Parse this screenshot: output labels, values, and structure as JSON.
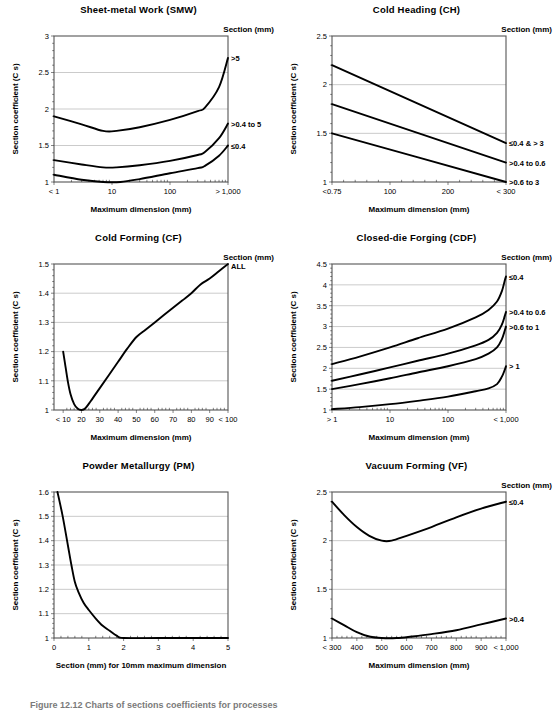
{
  "figure": {
    "caption": "Figure 12.12   Charts of sections coefficients for processes",
    "axis_labels": {
      "y_common": "Section coefficient (C s)",
      "x_max_dim": "Maximum dimension (mm)",
      "x_pm": "Section (mm) for 10mm maximum dimension"
    },
    "legend_header": "Section (mm)"
  },
  "chart_data": [
    {
      "type": "line",
      "id": "smw",
      "title": "Sheet-metal Work (SMW)",
      "xlabel": "Maximum dimension (mm)",
      "ylabel": "Section coefficient (C s)",
      "legend_title": "Section (mm)",
      "xscale": "log",
      "xlim": [
        1,
        1000
      ],
      "ylim": [
        1,
        3
      ],
      "yticks": [
        1,
        1.5,
        2,
        2.5,
        3
      ],
      "xticks": [
        1,
        10,
        100,
        1000
      ],
      "xticklabels": [
        "< 1",
        "10",
        "100",
        "> 1,000"
      ],
      "grid": true,
      "series": [
        {
          "name": ">5",
          "points": [
            [
              1,
              1.9
            ],
            [
              3,
              1.79
            ],
            [
              7,
              1.7
            ],
            [
              12,
              1.7
            ],
            [
              30,
              1.75
            ],
            [
              100,
              1.85
            ],
            [
              300,
              1.97
            ],
            [
              400,
              2.02
            ],
            [
              700,
              2.3
            ],
            [
              1000,
              2.7
            ]
          ]
        },
        {
          "name": ">0.4 to 5",
          "points": [
            [
              1,
              1.3
            ],
            [
              3,
              1.24
            ],
            [
              7,
              1.2
            ],
            [
              12,
              1.2
            ],
            [
              30,
              1.23
            ],
            [
              100,
              1.29
            ],
            [
              300,
              1.37
            ],
            [
              400,
              1.41
            ],
            [
              700,
              1.6
            ],
            [
              1000,
              1.8
            ]
          ]
        },
        {
          "name": "≤0.4",
          "points": [
            [
              1,
              1.1
            ],
            [
              3,
              1.03
            ],
            [
              7,
              1.0
            ],
            [
              14,
              1.0
            ],
            [
              30,
              1.04
            ],
            [
              100,
              1.12
            ],
            [
              300,
              1.19
            ],
            [
              400,
              1.22
            ],
            [
              700,
              1.36
            ],
            [
              1000,
              1.5
            ]
          ]
        }
      ]
    },
    {
      "type": "line",
      "id": "ch",
      "title": "Cold Heading (CH)",
      "xlabel": "Maximum dimension (mm)",
      "ylabel": "Section coefficient (C s)",
      "legend_title": "Section (mm)",
      "xscale": "linear",
      "xlim": [
        0,
        300
      ],
      "ylim": [
        1,
        2.5
      ],
      "yticks": [
        1,
        1.5,
        2,
        2.5
      ],
      "xticks": [
        0,
        100,
        200,
        300
      ],
      "xticklabels": [
        "<0.75",
        "100",
        "200",
        "< 300"
      ],
      "grid": true,
      "series": [
        {
          "name": "≤0.4 & > 3",
          "points": [
            [
              0,
              2.2
            ],
            [
              300,
              1.4
            ]
          ]
        },
        {
          "name": ">0.4 to 0.6",
          "points": [
            [
              0,
              1.8
            ],
            [
              300,
              1.2
            ]
          ]
        },
        {
          "name": ">0.6 to 3",
          "points": [
            [
              0,
              1.5
            ],
            [
              300,
              1.0
            ]
          ]
        }
      ]
    },
    {
      "type": "line",
      "id": "cf",
      "title": "Cold Forming (CF)",
      "xlabel": "Maximum dimension (mm)",
      "ylabel": "Section coefficient (C s)",
      "legend_title": "Section (mm)",
      "xscale": "linear",
      "xlim": [
        5,
        100
      ],
      "ylim": [
        1,
        1.5
      ],
      "yticks": [
        1,
        1.1,
        1.2,
        1.3,
        1.4,
        1.5
      ],
      "xticks": [
        10,
        20,
        30,
        40,
        50,
        60,
        70,
        80,
        90,
        100
      ],
      "xticklabels": [
        "< 10",
        "20",
        "30",
        "40",
        "50",
        "60",
        "70",
        "80",
        "90",
        "< 100"
      ],
      "grid": true,
      "series": [
        {
          "name": "ALL",
          "points": [
            [
              10,
              1.2
            ],
            [
              11,
              1.16
            ],
            [
              12.5,
              1.1
            ],
            [
              14,
              1.055
            ],
            [
              16,
              1.02
            ],
            [
              18,
              1.004
            ],
            [
              20,
              1.0
            ],
            [
              22,
              1.005
            ],
            [
              25,
              1.03
            ],
            [
              30,
              1.075
            ],
            [
              35,
              1.12
            ],
            [
              40,
              1.165
            ],
            [
              45,
              1.21
            ],
            [
              50,
              1.25
            ],
            [
              55,
              1.275
            ],
            [
              60,
              1.3
            ],
            [
              65,
              1.325
            ],
            [
              70,
              1.35
            ],
            [
              75,
              1.375
            ],
            [
              80,
              1.4
            ],
            [
              85,
              1.43
            ],
            [
              90,
              1.45
            ],
            [
              95,
              1.475
            ],
            [
              100,
              1.5
            ]
          ]
        }
      ]
    },
    {
      "type": "line",
      "id": "cdf",
      "title": "Closed-die Forging (CDF)",
      "xlabel": "Maximum dimension (mm)",
      "ylabel": "Section coefficient (C s)",
      "legend_title": "Section (mm)",
      "xscale": "log",
      "xlim": [
        1,
        1000
      ],
      "ylim": [
        1,
        4.5
      ],
      "yticks": [
        1,
        1.5,
        2,
        2.5,
        3,
        3.5,
        4,
        4.5
      ],
      "xticks": [
        1,
        10,
        100,
        1000
      ],
      "xticklabels": [
        "> 1",
        "10",
        "100",
        "< 1,000"
      ],
      "grid": true,
      "series": [
        {
          "name": "≤0.4",
          "points": [
            [
              1,
              2.1
            ],
            [
              3,
              2.28
            ],
            [
              10,
              2.5
            ],
            [
              30,
              2.72
            ],
            [
              100,
              2.95
            ],
            [
              300,
              3.22
            ],
            [
              500,
              3.4
            ],
            [
              700,
              3.6
            ],
            [
              850,
              3.85
            ],
            [
              950,
              4.1
            ],
            [
              1000,
              4.2
            ]
          ]
        },
        {
          "name": ">0.4 to 0.6",
          "points": [
            [
              1,
              1.7
            ],
            [
              3,
              1.85
            ],
            [
              10,
              2.02
            ],
            [
              30,
              2.18
            ],
            [
              100,
              2.35
            ],
            [
              300,
              2.55
            ],
            [
              500,
              2.68
            ],
            [
              700,
              2.85
            ],
            [
              850,
              3.05
            ],
            [
              950,
              3.25
            ],
            [
              1000,
              3.35
            ]
          ]
        },
        {
          "name": ">0.6 to 1",
          "points": [
            [
              1,
              1.5
            ],
            [
              3,
              1.62
            ],
            [
              10,
              1.76
            ],
            [
              30,
              1.9
            ],
            [
              100,
              2.05
            ],
            [
              300,
              2.22
            ],
            [
              500,
              2.35
            ],
            [
              700,
              2.5
            ],
            [
              850,
              2.7
            ],
            [
              950,
              2.9
            ],
            [
              1000,
              3.0
            ]
          ]
        },
        {
          "name": "> 1",
          "points": [
            [
              1,
              1.02
            ],
            [
              3,
              1.07
            ],
            [
              10,
              1.14
            ],
            [
              30,
              1.22
            ],
            [
              100,
              1.32
            ],
            [
              300,
              1.45
            ],
            [
              500,
              1.52
            ],
            [
              700,
              1.62
            ],
            [
              850,
              1.8
            ],
            [
              950,
              1.96
            ],
            [
              1000,
              2.05
            ]
          ]
        }
      ]
    },
    {
      "type": "line",
      "id": "pm",
      "title": "Powder Metallurgy (PM)",
      "xlabel": "Section (mm) for 10mm maximum dimension",
      "ylabel": "Section coefficient (C s)",
      "legend_title": "",
      "xscale": "linear",
      "xlim": [
        0,
        5
      ],
      "ylim": [
        1,
        1.6
      ],
      "yticks": [
        1,
        1.1,
        1.2,
        1.3,
        1.4,
        1.5,
        1.6
      ],
      "xticks": [
        0,
        1,
        2,
        3,
        4,
        5
      ],
      "xticklabels": [
        "0",
        "1",
        "2",
        "3",
        "4",
        "5"
      ],
      "grid": true,
      "series": [
        {
          "name": "",
          "points": [
            [
              0.1,
              1.6
            ],
            [
              0.25,
              1.5
            ],
            [
              0.4,
              1.38
            ],
            [
              0.5,
              1.3
            ],
            [
              0.6,
              1.23
            ],
            [
              0.7,
              1.19
            ],
            [
              0.85,
              1.145
            ],
            [
              1.0,
              1.115
            ],
            [
              1.2,
              1.08
            ],
            [
              1.4,
              1.05
            ],
            [
              1.6,
              1.03
            ],
            [
              1.8,
              1.01
            ],
            [
              2.0,
              1.0
            ],
            [
              3.0,
              1.0
            ],
            [
              4.0,
              1.0
            ],
            [
              5.0,
              1.0
            ]
          ]
        }
      ]
    },
    {
      "type": "line",
      "id": "vf",
      "title": "Vacuum Forming (VF)",
      "xlabel": "Maximum dimension (mm)",
      "ylabel": "Section coefficient (C s)",
      "legend_title": "Section (mm)",
      "xscale": "linear",
      "xlim": [
        300,
        1000
      ],
      "ylim": [
        1,
        2.5
      ],
      "yticks": [
        1,
        1.5,
        2,
        2.5
      ],
      "xticks": [
        300,
        400,
        500,
        600,
        700,
        800,
        900,
        1000
      ],
      "xticklabels": [
        "< 300",
        "400",
        "500",
        "600",
        "700",
        "800",
        "900",
        "< 1,000"
      ],
      "grid": true,
      "series": [
        {
          "name": "≤0.4",
          "points": [
            [
              300,
              2.4
            ],
            [
              350,
              2.26
            ],
            [
              400,
              2.14
            ],
            [
              450,
              2.05
            ],
            [
              500,
              2.0
            ],
            [
              540,
              2.0
            ],
            [
              600,
              2.05
            ],
            [
              700,
              2.14
            ],
            [
              800,
              2.24
            ],
            [
              900,
              2.33
            ],
            [
              1000,
              2.4
            ]
          ]
        },
        {
          "name": ">0.4",
          "points": [
            [
              300,
              1.2
            ],
            [
              350,
              1.13
            ],
            [
              400,
              1.06
            ],
            [
              450,
              1.015
            ],
            [
              500,
              1.0
            ],
            [
              560,
              1.0
            ],
            [
              620,
              1.015
            ],
            [
              700,
              1.04
            ],
            [
              800,
              1.08
            ],
            [
              900,
              1.14
            ],
            [
              1000,
              1.2
            ]
          ]
        }
      ]
    }
  ]
}
